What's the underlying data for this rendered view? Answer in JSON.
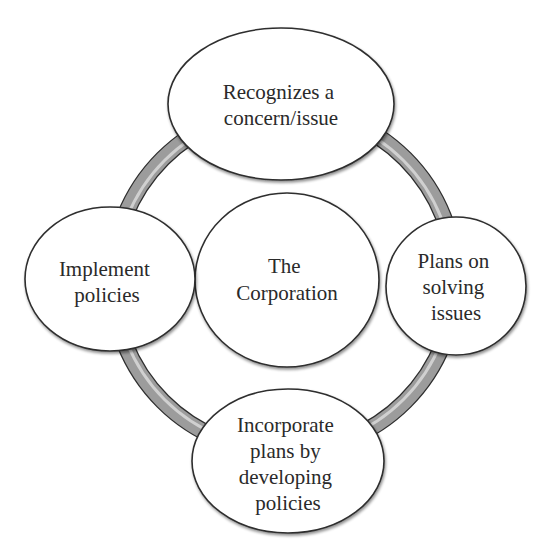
{
  "diagram": {
    "type": "cycle",
    "center": {
      "lines": [
        "The",
        "Corporation"
      ]
    },
    "nodes": [
      {
        "id": "top",
        "lines": [
          "Recognizes a",
          "concern/issue"
        ]
      },
      {
        "id": "right",
        "lines": [
          "Plans on",
          "solving",
          "issues"
        ]
      },
      {
        "id": "bottom",
        "lines": [
          "Incorporate",
          "plans by",
          "developing",
          "policies"
        ]
      },
      {
        "id": "left",
        "lines": [
          "Implement",
          "policies"
        ]
      }
    ],
    "colors": {
      "ring_fill": "#9c9c9c",
      "ring_highlight": "#e6e6e6",
      "outline": "#2e2e2e",
      "node_fill": "#ffffff",
      "text": "#2a2a2a"
    }
  }
}
